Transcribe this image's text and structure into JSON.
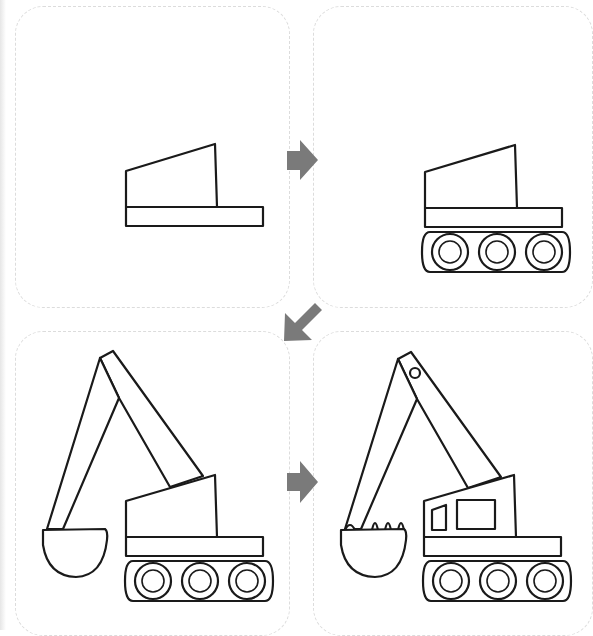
{
  "colors": {
    "line": "#1a1a1a",
    "arrow": "#7a7a7a",
    "card_border": "#dcdcdc",
    "background": "#ffffff"
  },
  "steps": [
    {
      "index": 1,
      "label": "Step 1: cab and base"
    },
    {
      "index": 2,
      "label": "Step 2: add crawler tracks with three wheels"
    },
    {
      "index": 3,
      "label": "Step 3: add boom, stick arm and bucket"
    },
    {
      "index": 4,
      "label": "Step 4: add windows, bucket teeth and pivot pin"
    }
  ],
  "arrows": [
    {
      "name": "arrow-right-1",
      "direction": "right"
    },
    {
      "name": "arrow-down-left",
      "direction": "down-left"
    },
    {
      "name": "arrow-right-2",
      "direction": "right"
    }
  ]
}
